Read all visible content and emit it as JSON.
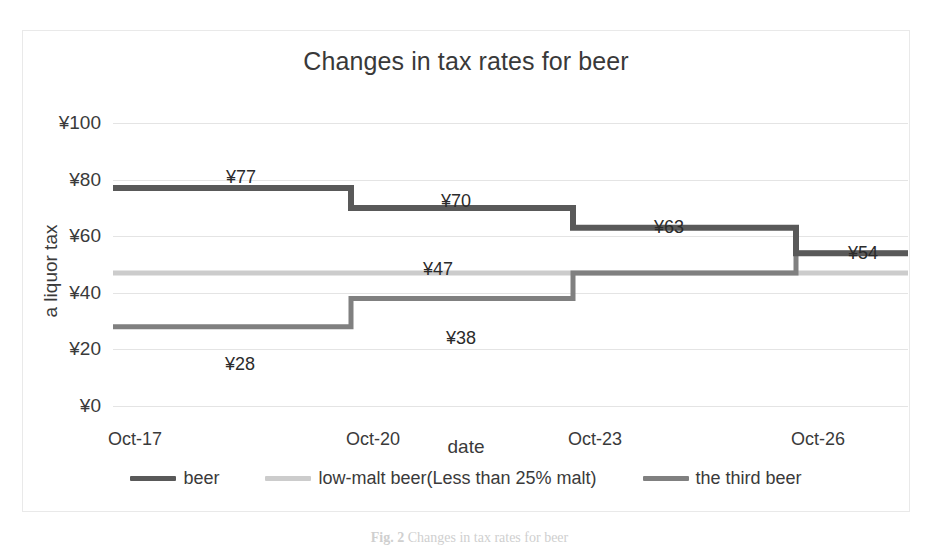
{
  "chart_data": {
    "type": "line",
    "subtype": "step",
    "title": "Changes in tax rates for beer",
    "xlabel": "date",
    "ylabel": "a liquor tax",
    "categories": [
      "Oct-17",
      "Oct-20",
      "Oct-23",
      "Oct-26"
    ],
    "ylim": [
      0,
      100
    ],
    "yticks": [
      "¥0",
      "¥20",
      "¥40",
      "¥60",
      "¥80",
      "¥100"
    ],
    "ytick_values": [
      0,
      20,
      40,
      60,
      80,
      100
    ],
    "grid": true,
    "legend_position": "bottom",
    "currency": "¥",
    "series": [
      {
        "name": "beer",
        "color": "#595959",
        "values": [
          77,
          70,
          63,
          54
        ],
        "labels": [
          "¥77",
          "¥70",
          "¥63",
          "¥54"
        ]
      },
      {
        "name": "low-malt beer(Less than 25% malt)",
        "color": "#cccccc",
        "values": [
          47,
          47,
          47,
          47
        ],
        "labels": [
          "¥47",
          "",
          "",
          ""
        ]
      },
      {
        "name": "the third beer",
        "color": "#808080",
        "values": [
          28,
          38,
          47,
          54
        ],
        "labels": [
          "¥28",
          "¥38",
          "",
          ""
        ]
      }
    ],
    "annotations": [
      {
        "text": "¥77",
        "x": 240,
        "y": 166
      },
      {
        "text": "¥70",
        "x": 455,
        "y": 190
      },
      {
        "text": "¥63",
        "x": 668,
        "y": 216
      },
      {
        "text": "¥54",
        "x": 862,
        "y": 242
      },
      {
        "text": "¥47",
        "x": 437,
        "y": 258
      },
      {
        "text": "¥38",
        "x": 460,
        "y": 327
      },
      {
        "text": "¥28",
        "x": 239,
        "y": 353
      }
    ]
  },
  "caption": {
    "label": "Fig. 2",
    "text": "Changes in tax rates for beer"
  }
}
